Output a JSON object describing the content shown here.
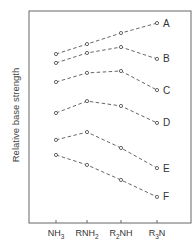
{
  "chart_data": {
    "type": "line",
    "title": "",
    "xlabel": "",
    "ylabel": "Relative base strength",
    "categories": [
      "NH3",
      "RNH2",
      "R2NH",
      "R3N"
    ],
    "category_labels": [
      {
        "main": "NH",
        "sub": "3",
        "prefix": "",
        "prefix_sub": "",
        "rest": ""
      },
      {
        "main": "RNH",
        "sub": "2",
        "prefix": "",
        "prefix_sub": "",
        "rest": ""
      },
      {
        "main": "R",
        "sub": "2",
        "prefix": "",
        "prefix_sub": "",
        "rest": "NH"
      },
      {
        "main": "R",
        "sub": "3",
        "prefix": "",
        "prefix_sub": "",
        "rest": "N"
      }
    ],
    "ylim": [
      0,
      100
    ],
    "y_ticks_shown": false,
    "grid": false,
    "legend": "inline labels at right end of each series",
    "line_style": "dashed with open circle markers",
    "series": [
      {
        "name": "A",
        "values": [
          79.7,
          84.4,
          89.6,
          94.3
        ]
      },
      {
        "name": "B",
        "values": [
          75.5,
          80.2,
          83.0,
          77.4
        ]
      },
      {
        "name": "C",
        "values": [
          66.5,
          70.8,
          71.7,
          62.7
        ]
      },
      {
        "name": "D",
        "values": [
          51.9,
          57.5,
          55.2,
          47.2
        ]
      },
      {
        "name": "E",
        "values": [
          39.2,
          42.9,
          35.4,
          25.9
        ]
      },
      {
        "name": "F",
        "values": [
          32.1,
          27.4,
          20.3,
          12.3
        ]
      }
    ],
    "colors": {
      "line": "#555555",
      "frame": "#666666",
      "text": "#333333"
    }
  }
}
